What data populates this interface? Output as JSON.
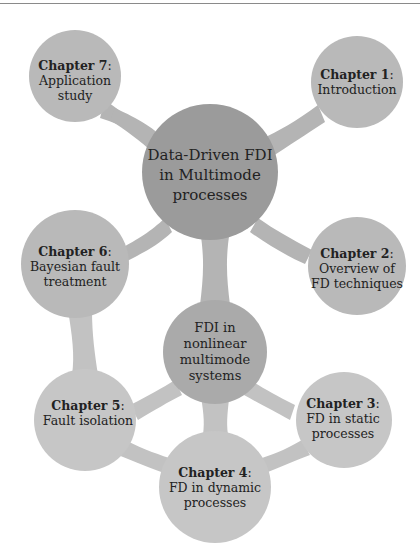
{
  "diagram": {
    "type": "mindmap",
    "colors": {
      "root": "#9b9b9b",
      "level1": "#b9b9b9",
      "subroot": "#aaaaaa",
      "level2": "#c6c6c6",
      "top_rule": "#8a8a8a"
    },
    "root": {
      "lines": [
        "Data-Driven FDI",
        "in Multimode",
        "processes"
      ]
    },
    "nodes": [
      {
        "id": "ch7",
        "chapter": "Chapter 7",
        "lines": [
          "Application",
          "study"
        ]
      },
      {
        "id": "ch1",
        "chapter": "Chapter 1",
        "lines": [
          "Introduction"
        ]
      },
      {
        "id": "ch6",
        "chapter": "Chapter 6",
        "lines": [
          "Bayesian fault",
          "treatment"
        ]
      },
      {
        "id": "ch2",
        "chapter": "Chapter 2",
        "lines": [
          "Overview of",
          "FD techniques"
        ]
      }
    ],
    "subroot": {
      "lines": [
        "FDI in",
        "nonlinear",
        "multimode",
        "systems"
      ]
    },
    "subnodes": [
      {
        "id": "ch5",
        "chapter": "Chapter 5",
        "lines": [
          "Fault isolation"
        ]
      },
      {
        "id": "ch3",
        "chapter": "Chapter 3",
        "lines": [
          "FD in static",
          "processes"
        ]
      },
      {
        "id": "ch4",
        "chapter": "Chapter 4",
        "lines": [
          "FD in dynamic",
          "processes"
        ]
      }
    ],
    "colon": ":"
  }
}
